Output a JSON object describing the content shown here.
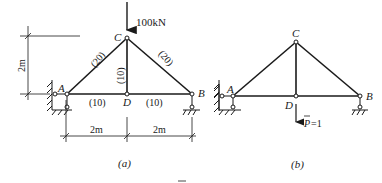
{
  "figure_a": {
    "caption": "(a)",
    "nodes": {
      "A": "A",
      "B": "B",
      "C": "C",
      "D": "D"
    },
    "load_label": "100kN",
    "height_dim": "2m",
    "span_dims": [
      "2m",
      "2m"
    ],
    "member_forces": {
      "AC": "(20)",
      "CB": "(20)",
      "CD": "(10)",
      "AD": "(10)",
      "DB": "(10)"
    }
  },
  "figure_b": {
    "caption": "(b)",
    "nodes": {
      "A": "A",
      "B": "B",
      "C": "C",
      "D": "D"
    },
    "unit_load_label": "P=1",
    "unit_load_symbol": "P",
    "unit_load_value": "=1"
  },
  "colors": {
    "line": "#1a1a1a",
    "background": "#ffffff"
  }
}
